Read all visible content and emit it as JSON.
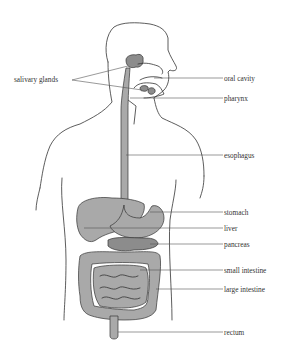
{
  "diagram": {
    "labels": {
      "salivary_glands": "salivary glands",
      "oral_cavity": "oral cavity",
      "pharynx": "pharynx",
      "esophagus": "esophagus",
      "stomach": "stomach",
      "liver": "liver",
      "pancreas": "pancreas",
      "small_intestine": "small intestine",
      "large_intestine": "large intestine",
      "rectum": "rectum"
    },
    "colors": {
      "organ_fill": "#a9a9a9",
      "outline": "#333333",
      "text": "#333333",
      "background": "#ffffff"
    }
  }
}
